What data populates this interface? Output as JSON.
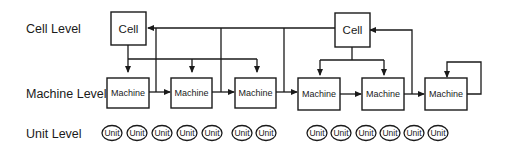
{
  "levels": {
    "cell": "Cell Level",
    "machine": "Machine Level",
    "unit": "Unit Level"
  },
  "cells": [
    {
      "label": "Cell"
    },
    {
      "label": "Cell"
    }
  ],
  "machines": [
    {
      "label": "Machine"
    },
    {
      "label": "Machine"
    },
    {
      "label": "Machine"
    },
    {
      "label": "Machine"
    },
    {
      "label": "Machine"
    },
    {
      "label": "Machine"
    }
  ],
  "units": [
    {
      "label": "Unit"
    },
    {
      "label": "Unit"
    },
    {
      "label": "Unit"
    },
    {
      "label": "Unit"
    },
    {
      "label": "Unit"
    },
    {
      "label": "Unit"
    },
    {
      "label": "Unit"
    },
    {
      "label": "Unit"
    },
    {
      "label": "Unit"
    },
    {
      "label": "Unit"
    },
    {
      "label": "Unit"
    },
    {
      "label": "Unit"
    },
    {
      "label": "Unit"
    }
  ]
}
